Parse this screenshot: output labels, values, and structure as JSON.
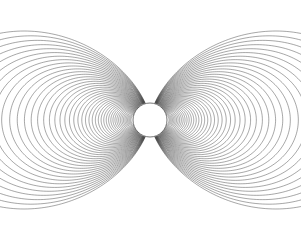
{
  "figure": {
    "type": "vector-field-diagram",
    "background_color": "#ffffff",
    "line_color": "#3a3a3a",
    "line_width": 0.45,
    "width": 301,
    "height": 239
  },
  "chart_data": {
    "type": "line",
    "subtitle": "",
    "xlabel": "",
    "ylabel": "",
    "grid": false,
    "legend": null,
    "axis_visible": false,
    "tick_labels": [],
    "annotations": [],
    "model": {
      "equation": "r = L * cos^2(lambda)",
      "description": "Ideal magnetic dipole field lines in the meridional plane; dipole axis vertical (poles at top and bottom of the sphere).",
      "center_x": 150,
      "center_y": 120,
      "sphere_radius_px": 17,
      "axis_tilt_degrees": 0,
      "aspect_ratio": 1.0
    },
    "series": [
      {
        "name": "dipole-field-lines",
        "count": 46,
        "parameter_name": "L",
        "parameter_units": "sphere radii",
        "parameter_min": 1.12,
        "parameter_max": 13.6,
        "parameter_spacing": "geometric",
        "closed_loops": true,
        "mirrored_about_vertical_axis": true
      }
    ],
    "outer_boundary": {
      "name": "outermost-shell-band",
      "description": "Densest outermost field lines form a thick dark annulus",
      "radius_px": 114,
      "band_thickness_px": 13,
      "left_edge_x": 36,
      "right_edge_x": 264,
      "top_y": 15,
      "bottom_y": 225
    },
    "overflow_arcs": {
      "name": "corner-arcs",
      "description": "Field lines with L large enough to exit the frame, appearing as arcs crossing the four corners",
      "count": 4,
      "corners": [
        "top-left",
        "top-right",
        "bottom-left",
        "bottom-right"
      ]
    },
    "central_sphere": {
      "name": "central-body",
      "fill": "#ffffff",
      "stroke": "#3a3a3a",
      "center": [
        150,
        120
      ],
      "radius": 17
    }
  }
}
